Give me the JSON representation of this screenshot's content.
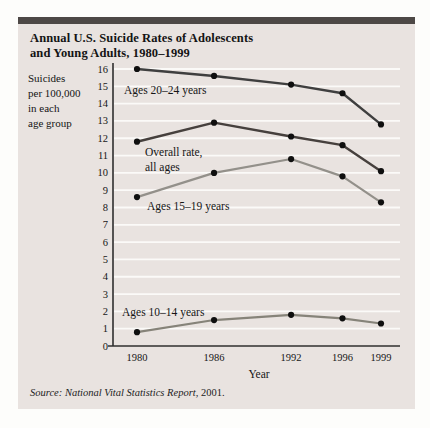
{
  "panel": {
    "title_line1": "Annual U.S. Suicide Rates of Adolescents",
    "title_line2": "and Young Adults, 1980–1999",
    "source_prefix": "Source: National Vital Statistics Report,",
    "source_suffix": " 2001."
  },
  "chart_data": {
    "type": "line",
    "title": "Annual U.S. Suicide Rates of Adolescents and Young Adults, 1980–1999",
    "xlabel": "Year",
    "ylabel": "Suicides per 100,000 in each age group",
    "ylabel_lines": [
      "Suicides",
      "per 100,000",
      "in each",
      "age group"
    ],
    "x": [
      1980,
      1986,
      1992,
      1996,
      1999
    ],
    "x_tick_labels": [
      "1980",
      "1986",
      "1992",
      "1996",
      "1999"
    ],
    "ylim": [
      0,
      16
    ],
    "y_tick_step": 1,
    "grid": "horizontal-white-lines",
    "legend_position": "inline-annotations",
    "colors": {
      "panel_background": "#e9e3e0",
      "accent_bar": "#4d4846",
      "gridline": "#fbfaf8",
      "axis": "#2f2f2f",
      "point": "#0f0f0f"
    },
    "series": [
      {
        "name": "Ages 20–24 years",
        "label_lines": [
          "Ages 20–24 years"
        ],
        "color": "#3f3f3f",
        "width": 2.4,
        "values": [
          16.0,
          15.6,
          15.1,
          14.6,
          12.8
        ]
      },
      {
        "name": "Overall rate, all ages",
        "label_lines": [
          "Overall rate,",
          "all ages"
        ],
        "color": "#46403d",
        "width": 2.4,
        "values": [
          11.8,
          12.9,
          12.1,
          11.6,
          10.1
        ]
      },
      {
        "name": "Ages 15–19 years",
        "label_lines": [
          "Ages 15–19 years"
        ],
        "color": "#93908a",
        "width": 2.2,
        "values": [
          8.6,
          10.0,
          10.8,
          9.8,
          8.3
        ]
      },
      {
        "name": "Ages 10–14 years",
        "label_lines": [
          "Ages 10–14 years"
        ],
        "color": "#868379",
        "width": 2.2,
        "values": [
          0.8,
          1.5,
          1.8,
          1.6,
          1.3
        ]
      }
    ]
  }
}
